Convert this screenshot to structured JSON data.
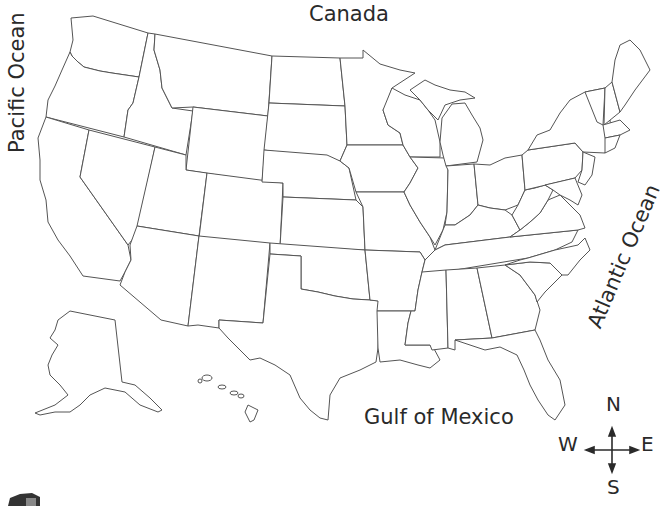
{
  "map": {
    "title": "United States outline map",
    "labels": {
      "north_border": "Canada",
      "west_ocean": "Pacific Ocean",
      "east_ocean": "Atlantic Ocean",
      "south_water": "Gulf of Mexico"
    },
    "compass": {
      "north": "N",
      "south": "S",
      "east": "E",
      "west": "W"
    },
    "colors": {
      "outline": "#555555",
      "background": "#ffffff",
      "text": "#2a2a2a"
    }
  }
}
